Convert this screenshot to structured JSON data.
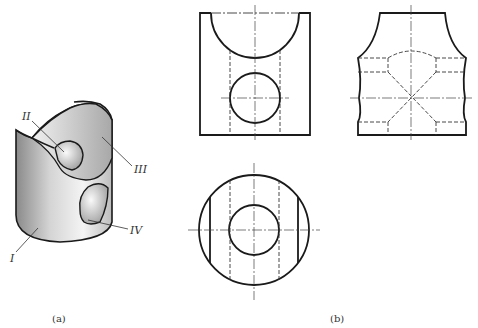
{
  "figure": {
    "panel_a": {
      "caption": "(a)",
      "description": "Isometric view of cylinder with cut-outs",
      "labels": {
        "I": "I",
        "II": "II",
        "III": "III",
        "IV": "IV"
      }
    },
    "panel_b": {
      "caption": "(b)",
      "views": [
        "front-view",
        "side-view",
        "top-view"
      ]
    }
  }
}
